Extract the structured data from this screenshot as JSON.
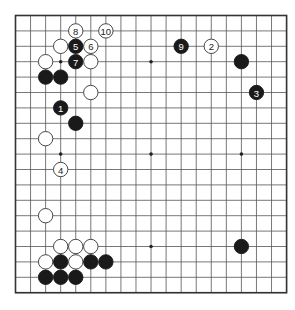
{
  "board": {
    "size": 19,
    "origin_x": 15.5,
    "origin_y": 15.5,
    "spacing_x": 15.06,
    "spacing_y": 15.4,
    "stone_radius": 7.2,
    "colors": {
      "background": "#ffffff",
      "line": "#555555",
      "border": "#333333",
      "black_stone": "#1a1a1a",
      "white_stone": "#ffffff",
      "white_outline": "#333333"
    },
    "star_points": [
      [
        3,
        3
      ],
      [
        9,
        3
      ],
      [
        15,
        3
      ],
      [
        3,
        9
      ],
      [
        9,
        9
      ],
      [
        15,
        9
      ],
      [
        3,
        15
      ],
      [
        9,
        15
      ],
      [
        15,
        15
      ]
    ]
  },
  "stones": [
    {
      "color": "black",
      "col": 3,
      "row": 6,
      "label": "1"
    },
    {
      "color": "white",
      "col": 13,
      "row": 2,
      "label": "2"
    },
    {
      "color": "black",
      "col": 16,
      "row": 5,
      "label": "3"
    },
    {
      "color": "white",
      "col": 3,
      "row": 10,
      "label": "4"
    },
    {
      "color": "black",
      "col": 4,
      "row": 2,
      "label": "5"
    },
    {
      "color": "white",
      "col": 5,
      "row": 2,
      "label": "6"
    },
    {
      "color": "black",
      "col": 4,
      "row": 3,
      "label": "7"
    },
    {
      "color": "white",
      "col": 4,
      "row": 1,
      "label": "8"
    },
    {
      "color": "black",
      "col": 11,
      "row": 2,
      "label": "9"
    },
    {
      "color": "white",
      "col": 6,
      "row": 1,
      "label": "10"
    },
    {
      "color": "white",
      "col": 3,
      "row": 2,
      "label": ""
    },
    {
      "color": "white",
      "col": 2,
      "row": 3,
      "label": ""
    },
    {
      "color": "white",
      "col": 5,
      "row": 3,
      "label": ""
    },
    {
      "color": "black",
      "col": 2,
      "row": 4,
      "label": ""
    },
    {
      "color": "black",
      "col": 3,
      "row": 4,
      "label": ""
    },
    {
      "color": "white",
      "col": 5,
      "row": 5,
      "label": ""
    },
    {
      "color": "black",
      "col": 4,
      "row": 7,
      "label": ""
    },
    {
      "color": "white",
      "col": 2,
      "row": 8,
      "label": ""
    },
    {
      "color": "black",
      "col": 15,
      "row": 3,
      "label": ""
    },
    {
      "color": "white",
      "col": 2,
      "row": 13,
      "label": ""
    },
    {
      "color": "black",
      "col": 15,
      "row": 15,
      "label": ""
    },
    {
      "color": "white",
      "col": 3,
      "row": 15,
      "label": ""
    },
    {
      "color": "white",
      "col": 4,
      "row": 15,
      "label": ""
    },
    {
      "color": "white",
      "col": 5,
      "row": 15,
      "label": ""
    },
    {
      "color": "white",
      "col": 2,
      "row": 16,
      "label": ""
    },
    {
      "color": "black",
      "col": 3,
      "row": 16,
      "label": ""
    },
    {
      "color": "white",
      "col": 4,
      "row": 16,
      "label": ""
    },
    {
      "color": "black",
      "col": 5,
      "row": 16,
      "label": ""
    },
    {
      "color": "black",
      "col": 6,
      "row": 16,
      "label": ""
    },
    {
      "color": "black",
      "col": 2,
      "row": 17,
      "label": ""
    },
    {
      "color": "black",
      "col": 3,
      "row": 17,
      "label": ""
    },
    {
      "color": "black",
      "col": 4,
      "row": 17,
      "label": ""
    }
  ]
}
